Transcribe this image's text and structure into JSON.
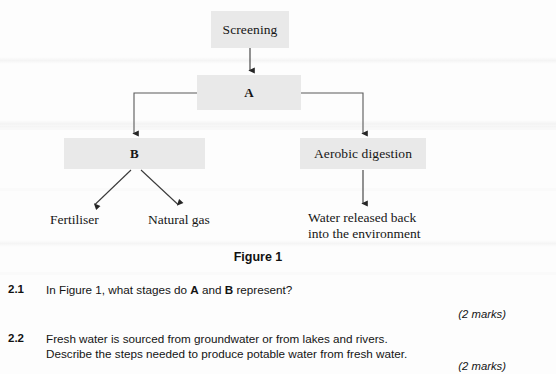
{
  "figure": {
    "caption": "Figure 1",
    "boxes": [
      {
        "id": "screening",
        "label": "Screening"
      },
      {
        "id": "a",
        "label": "A"
      },
      {
        "id": "b",
        "label": "B"
      },
      {
        "id": "aerobic",
        "label": "Aerobic digestion"
      }
    ],
    "leaves": [
      {
        "id": "fertiliser",
        "label": "Fertiliser"
      },
      {
        "id": "natural_gas",
        "label": "Natural gas"
      },
      {
        "id": "water",
        "label": "Water released back into the environment"
      }
    ],
    "box_fill": "#e9e9e9",
    "line_color": "#3a3a3a"
  },
  "questions": [
    {
      "number": "2.1",
      "lines": [
        "In Figure 1, what stages do A and B represent?"
      ],
      "text_before_a": "In Figure 1, what stages do ",
      "bold_a": "A",
      "text_between": " and ",
      "bold_b": "B",
      "text_after_b": " represent?",
      "marks": "(2 marks)"
    },
    {
      "number": "2.2",
      "line1": "Fresh water is sourced from groundwater or from lakes and rivers.",
      "line2": "Describe the steps needed to produce potable water from fresh water.",
      "marks": "(2 marks)"
    }
  ]
}
